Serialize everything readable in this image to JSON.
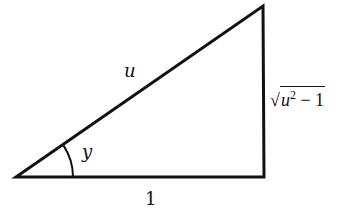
{
  "diagram": {
    "type": "right-triangle",
    "hypotenuse_label": "u",
    "angle_label": "y",
    "adjacent_label": "1",
    "opposite_label": {
      "radical": "√",
      "base": "u",
      "exponent": "2",
      "rest": " − 1"
    },
    "stroke_color": "#111111"
  }
}
